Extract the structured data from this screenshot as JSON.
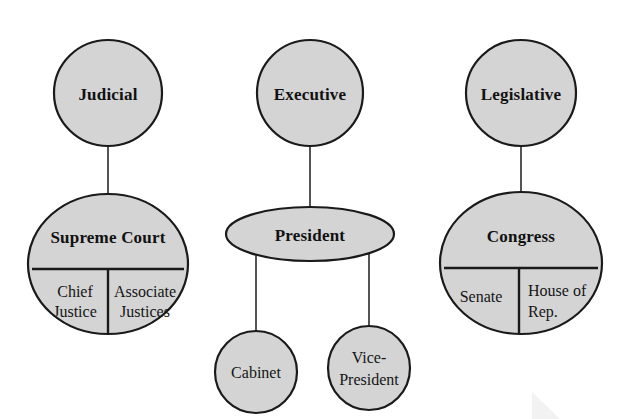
{
  "diagram": {
    "colors": {
      "node_fill": "#d4d4d4",
      "node_stroke": "#1a1a1a",
      "connector": "#2a2a2a",
      "background": "#ffffff",
      "text": "#111111"
    },
    "branches": [
      {
        "key": "judicial",
        "top_label": "Judicial",
        "main_label": "Supreme Court",
        "sub_labels": [
          "Chief Justice",
          "Associate Justices"
        ]
      },
      {
        "key": "executive",
        "top_label": "Executive",
        "main_label": "President",
        "sub_labels": [
          "Cabinet",
          "Vice-President"
        ]
      },
      {
        "key": "legislative",
        "top_label": "Legislative",
        "main_label": "Congress",
        "sub_labels": [
          "Senate",
          "House of Rep."
        ]
      }
    ],
    "nodes": {
      "judicial_top": "Judicial",
      "executive_top": "Executive",
      "legislative_top": "Legislative",
      "supreme_court": "Supreme Court",
      "president": "President",
      "congress": "Congress",
      "chief_justice_line1": "Chief",
      "chief_justice_line2": "Justice",
      "associate_justices_line1": "Associate",
      "associate_justices_line2": "Justices",
      "cabinet": "Cabinet",
      "vice_president_line1": "Vice-",
      "vice_president_line2": "President",
      "senate": "Senate",
      "house_of_rep_line1": "House of",
      "house_of_rep_line2": "Rep."
    }
  }
}
